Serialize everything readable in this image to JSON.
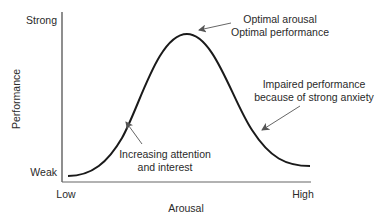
{
  "axes": {
    "y_label": "Performance",
    "y_top": "Strong",
    "y_bottom": "Weak",
    "x_label": "Arousal",
    "x_left": "Low",
    "x_right": "High"
  },
  "annotations": {
    "peak_line1": "Optimal arousal",
    "peak_line2": "Optimal performance",
    "right_line1": "Impaired performance",
    "right_line2": "because of strong anxiety",
    "left_line1": "Increasing attention",
    "left_line2": "and interest"
  },
  "colors": {
    "curve": "#1a1a1a",
    "axis": "#444444",
    "text": "#2a2a2a",
    "arrow": "#555555"
  }
}
